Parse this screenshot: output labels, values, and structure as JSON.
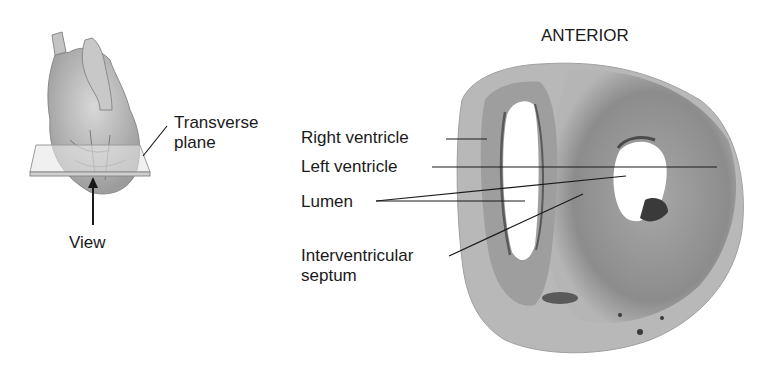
{
  "title": "ANTERIOR",
  "inset": {
    "plane_label_line1": "Transverse",
    "plane_label_line2": "plane",
    "view_label": "View"
  },
  "labels": {
    "right_ventricle": "Right ventricle",
    "left_ventricle": "Left ventricle",
    "lumen": "Lumen",
    "septum_line1": "Interventricular",
    "septum_line2": "septum"
  },
  "colors": {
    "tissue_light": "#c9c9c9",
    "tissue_mid": "#9a9a9a",
    "tissue_dark": "#6e6e6e",
    "line": "#1a1a1a"
  }
}
